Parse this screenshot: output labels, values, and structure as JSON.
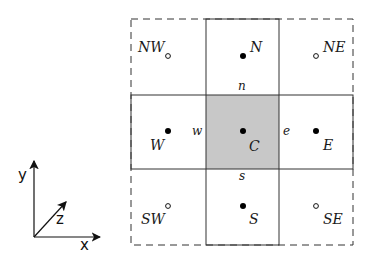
{
  "diagram": {
    "type": "finite-volume stencil (5-point with corner neighbors)",
    "colors": {
      "line": "#333333",
      "center_fill": "#c8c8c8",
      "point": "#000000"
    },
    "nodes": [
      {
        "id": "NW",
        "label": "NW",
        "style": "hollow"
      },
      {
        "id": "N",
        "label": "N",
        "style": "filled"
      },
      {
        "id": "NE",
        "label": "NE",
        "style": "hollow"
      },
      {
        "id": "W",
        "label": "W",
        "style": "filled"
      },
      {
        "id": "C",
        "label": "C",
        "style": "filled",
        "shaded_cell": true
      },
      {
        "id": "E",
        "label": "E",
        "style": "filled"
      },
      {
        "id": "SW",
        "label": "SW",
        "style": "hollow"
      },
      {
        "id": "S",
        "label": "S",
        "style": "filled"
      },
      {
        "id": "SE",
        "label": "SE",
        "style": "hollow"
      }
    ],
    "faces": {
      "n": "n",
      "s": "s",
      "e": "e",
      "w": "w"
    },
    "axes": {
      "x": "x",
      "y": "y",
      "z": "z"
    },
    "outer_border": "dashed"
  }
}
